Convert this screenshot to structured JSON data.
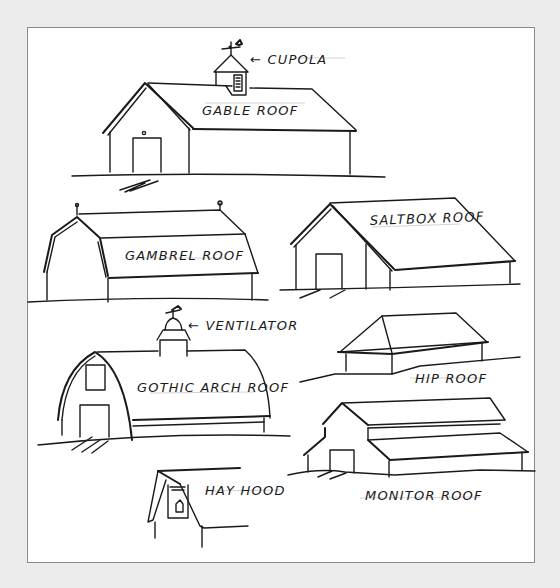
{
  "figure": {
    "type": "hand-drawn sketch",
    "colors": {
      "ink": "#1a1a1a",
      "paper": "#ffffff",
      "background": "#ececec",
      "frame": "#8a8a8a"
    }
  },
  "labels": {
    "cupola": "← CUPOLA",
    "gable": "GABLE ROOF",
    "gambrel": "GAMBREL ROOF",
    "saltbox": "SALTBOX ROOF",
    "ventilator": "← VENTILATOR",
    "gothic": "GOTHIC ARCH ROOF",
    "hip": "HIP ROOF",
    "monitor": "MONITOR ROOF",
    "hayhood": "HAY HOOD"
  },
  "drawings": [
    {
      "id": "gable-barn",
      "label_key": "gable",
      "features": [
        "cupola",
        "weathervane",
        "door"
      ]
    },
    {
      "id": "gambrel-barn",
      "label_key": "gambrel",
      "features": [
        "finials"
      ]
    },
    {
      "id": "saltbox-barn",
      "label_key": "saltbox",
      "features": [
        "door"
      ]
    },
    {
      "id": "gothic-arch-barn",
      "label_key": "gothic",
      "features": [
        "ventilator",
        "weathervane",
        "door",
        "loft-window"
      ]
    },
    {
      "id": "hip-roof-barn",
      "label_key": "hip",
      "features": []
    },
    {
      "id": "monitor-barn",
      "label_key": "monitor",
      "features": [
        "door"
      ]
    },
    {
      "id": "hay-hood-detail",
      "label_key": "hayhood",
      "features": [
        "loft-opening"
      ]
    }
  ]
}
